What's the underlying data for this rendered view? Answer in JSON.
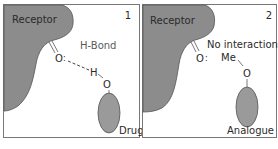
{
  "panels": [
    {
      "number": "1",
      "receptor_label": "Receptor",
      "interaction_label": "H-Bond",
      "receptor_atom": "O",
      "ligand_atom_h": "H",
      "ligand_atom_o": "O",
      "ligand_label": "Drug"
    },
    {
      "number": "2",
      "receptor_label": "Receptor",
      "interaction_label": "No interaction",
      "receptor_atom": "O",
      "ligand_group": "Me",
      "ligand_atom_o": "O",
      "ligand_label": "Analogue"
    }
  ],
  "colors": {
    "receptor_fill": "#8c8c8c",
    "ligand_fill": "#9a9a9a",
    "border": "#5a5a5a",
    "text": "#2a2a2a"
  }
}
